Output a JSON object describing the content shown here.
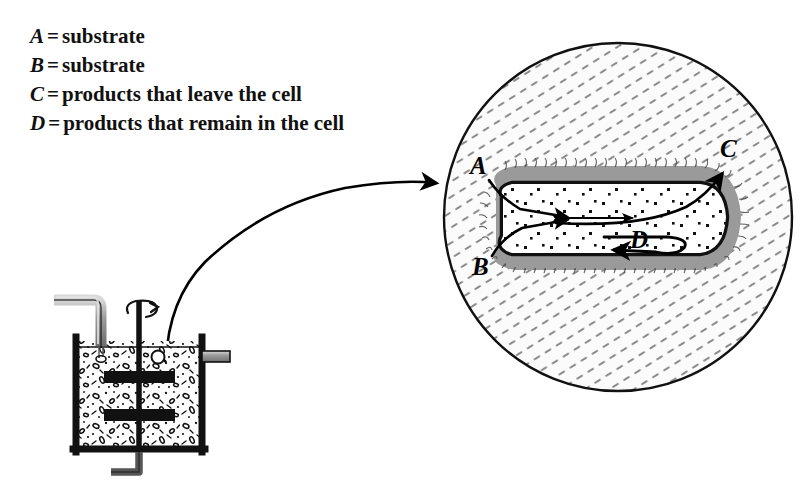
{
  "figure": {
    "background_color": "#ffffff",
    "ink_color": "#111111"
  },
  "legend": {
    "name": "symbol-key",
    "equals_sign": "=",
    "items": [
      {
        "symbol": "A",
        "definition": "substrate"
      },
      {
        "symbol": "B",
        "definition": "substrate"
      },
      {
        "symbol": "C",
        "definition": "products that leave the cell"
      },
      {
        "symbol": "D",
        "definition": "products that remain in the cell"
      }
    ]
  },
  "bioreactor": {
    "name": "stirred-tank-bioreactor",
    "vessel": {
      "x": 73,
      "y": 337,
      "width": 132,
      "height": 116,
      "wall_color": "#111111",
      "wall_thickness": 7
    },
    "medium": {
      "fill_color": "#fbfbfb",
      "speckle_color": "#111111",
      "description": "culture broth with suspended cells"
    },
    "feed_pipe": {
      "name": "inlet-pipe",
      "color": "#8e8e8e",
      "outline": "#111111",
      "description": "bent inlet tube pouring medium into vessel"
    },
    "impeller_shaft": {
      "name": "impeller-shaft",
      "color": "#111111"
    },
    "impeller_blades": {
      "count": 2,
      "color": "#111111"
    },
    "rotation_indicator": {
      "name": "rotation-arrow",
      "description": "curved arrow around shaft indicating stirring"
    },
    "outlet_port": {
      "name": "outlet-port",
      "color": "#8e8e8e",
      "description": "horizontal sampling tube on right wall"
    },
    "drain_pipe": {
      "name": "drain-pipe",
      "color": "#555555",
      "description": "L-shaped bottom drain"
    }
  },
  "magnifier": {
    "name": "magnification-callout",
    "pointer": {
      "description": "curved arrow from vessel to magnified circle"
    },
    "circle": {
      "cx": 618,
      "cy": 217,
      "r": 175,
      "border_color": "#111111",
      "hatch_color": "#8b8b8b",
      "fill_color": "#fbfbfb",
      "description": "magnified view of culture medium"
    }
  },
  "cell": {
    "name": "microbial-cell",
    "shape": "rod-shaped (bacillus)",
    "cell_wall_color": "#9a9a9a",
    "membrane_color": "#111111",
    "cytoplasm_color": "#ffffff",
    "granule_color": "#111111",
    "labels": [
      {
        "id": "A",
        "text": "A",
        "x": 478,
        "y": 172,
        "role": "substrate entering cell"
      },
      {
        "id": "B",
        "text": "B",
        "x": 481,
        "y": 270,
        "role": "substrate entering cell"
      },
      {
        "id": "C",
        "text": "C",
        "x": 729,
        "y": 152,
        "role": "product leaving cell"
      },
      {
        "id": "D",
        "text": "D",
        "x": 641,
        "y": 243,
        "role": "product retained in cell"
      }
    ]
  }
}
